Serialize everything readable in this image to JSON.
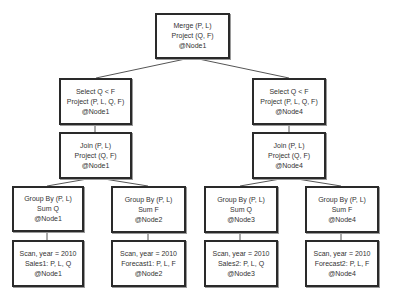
{
  "diagram": {
    "type": "query-plan-tree",
    "colors": {
      "border": "#2a2a2a",
      "edge": "#555555",
      "text": "#333333",
      "background": "#ffffff"
    },
    "nodes": {
      "merge": {
        "lines": [
          "Merge (P, L)",
          "Project (Q, F)",
          "@Node1"
        ]
      },
      "select_left": {
        "lines": [
          "Select Q < F",
          "Project (P, L, Q, F)",
          "@Node1"
        ]
      },
      "select_right": {
        "lines": [
          "Select Q < F",
          "Project (P, L, Q, F)",
          "@Node4"
        ]
      },
      "join_left": {
        "lines": [
          "Join (P, L)",
          "Project (Q, F)",
          "@Node1"
        ]
      },
      "join_right": {
        "lines": [
          "Join (P, L)",
          "Project (Q, F)",
          "@Node4"
        ]
      },
      "groupby_1": {
        "lines": [
          "Group By (P, L)",
          "Sum Q",
          "@Node1"
        ]
      },
      "groupby_2": {
        "lines": [
          "Group By (P, L)",
          "Sum F",
          "@Node2"
        ]
      },
      "groupby_3": {
        "lines": [
          "Group By (P, L)",
          "Sum Q",
          "@Node3"
        ]
      },
      "groupby_4": {
        "lines": [
          "Group By (P, L)",
          "Sum F",
          "@Node4"
        ]
      },
      "scan_1": {
        "lines": [
          "Scan, year = 2010",
          "Sales1: P, L, Q",
          "@Node1"
        ]
      },
      "scan_2": {
        "lines": [
          "Scan, year = 2010",
          "Forecast1: P, L, F",
          "@Node2"
        ]
      },
      "scan_3": {
        "lines": [
          "Scan, year = 2010",
          "Sales2: P, L, Q",
          "@Node3"
        ]
      },
      "scan_4": {
        "lines": [
          "Scan, year = 2010",
          "Forecast2: P, L, F",
          "@Node4"
        ]
      }
    },
    "edges": [
      [
        "merge",
        "select_left"
      ],
      [
        "merge",
        "select_right"
      ],
      [
        "select_left",
        "join_left"
      ],
      [
        "select_right",
        "join_right"
      ],
      [
        "join_left",
        "groupby_1"
      ],
      [
        "join_left",
        "groupby_2"
      ],
      [
        "join_right",
        "groupby_3"
      ],
      [
        "join_right",
        "groupby_4"
      ],
      [
        "groupby_1",
        "scan_1"
      ],
      [
        "groupby_2",
        "scan_2"
      ],
      [
        "groupby_3",
        "scan_3"
      ],
      [
        "groupby_4",
        "scan_4"
      ]
    ]
  }
}
